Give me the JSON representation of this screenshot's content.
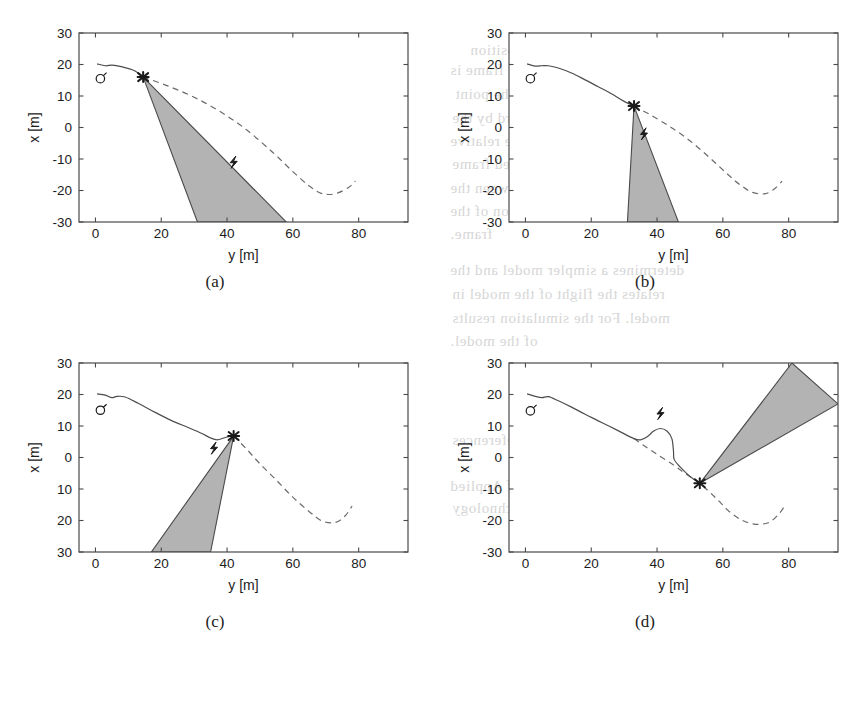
{
  "figure": {
    "title_none": "",
    "panels": [
      {
        "id": "a",
        "caption": "(a)",
        "axes": {
          "xlabel": "y [m]",
          "ylabel": "x [m]",
          "xticks": [
            "0",
            "20",
            "40",
            "60",
            "80"
          ],
          "xtick_values": [
            0,
            20,
            40,
            60,
            80
          ],
          "yticks": [
            "30",
            "20",
            "10",
            "0",
            "-10",
            "-20",
            "-30"
          ],
          "ytick_values": [
            30,
            20,
            10,
            0,
            -10,
            -20,
            -30
          ],
          "xlim": [
            -5,
            95
          ],
          "ylim": [
            -30,
            30
          ],
          "grid": false,
          "box": true
        },
        "markers": {
          "start_circle": {
            "name": "circle-marker",
            "y": 1.5,
            "x": 15.5
          },
          "target_cross": {
            "name": "cross-marker",
            "y": 14.5,
            "x": 16.0
          },
          "glyph": {
            "name": "bolt-glyph",
            "y": 42.0,
            "x": -11.0
          }
        },
        "cone": {
          "apex": [
            14.5,
            16.0
          ],
          "left_base": [
            31.0,
            -30.0
          ],
          "right_base": [
            58.0,
            -30.0
          ],
          "fill": "#b3b3b3"
        },
        "solid_path": [
          [
            0.5,
            20.2
          ],
          [
            3,
            19.6
          ],
          [
            5,
            19.8
          ],
          [
            7,
            19.5
          ],
          [
            9,
            19.0
          ],
          [
            11,
            18.4
          ],
          [
            13,
            17.3
          ],
          [
            14.5,
            16.0
          ]
        ],
        "dashed_path": [
          [
            14.5,
            16.0
          ],
          [
            22,
            13.2
          ],
          [
            30,
            9.6
          ],
          [
            38,
            5.0
          ],
          [
            46,
            -0.8
          ],
          [
            54,
            -8.0
          ],
          [
            60,
            -14.0
          ],
          [
            65,
            -18.6
          ],
          [
            69,
            -21.0
          ],
          [
            73,
            -21.0
          ],
          [
            77,
            -19.0
          ],
          [
            79,
            -17.0
          ]
        ]
      },
      {
        "id": "b",
        "caption": "(b)",
        "axes": {
          "xlabel": "y [m]",
          "ylabel": "x [m]",
          "xticks": [
            "0",
            "20",
            "40",
            "60",
            "80"
          ],
          "xtick_values": [
            0,
            20,
            40,
            60,
            80
          ],
          "yticks": [
            "30",
            "20",
            "10",
            "0",
            "-10",
            "-20",
            "-30"
          ],
          "ytick_values": [
            30,
            20,
            10,
            0,
            -10,
            -20,
            -30
          ],
          "xlim": [
            -5,
            95
          ],
          "ylim": [
            -30,
            30
          ],
          "grid": false,
          "box": true
        },
        "markers": {
          "start_circle": {
            "name": "circle-marker",
            "y": 1.5,
            "x": 15.5
          },
          "target_cross": {
            "name": "cross-marker",
            "y": 33.0,
            "x": 6.8
          },
          "glyph": {
            "name": "bolt-glyph",
            "y": 36.0,
            "x": -2.0
          }
        },
        "cone": {
          "apex": [
            33.0,
            6.8
          ],
          "left_base": [
            31.0,
            -30.0
          ],
          "right_base": [
            46.5,
            -30.0
          ],
          "fill": "#b3b3b3"
        },
        "solid_path": [
          [
            0.5,
            20.2
          ],
          [
            3,
            19.5
          ],
          [
            5,
            19.6
          ],
          [
            7,
            19.6
          ],
          [
            10,
            18.9
          ],
          [
            14,
            17.3
          ],
          [
            18,
            15.2
          ],
          [
            22,
            13.0
          ],
          [
            26,
            10.8
          ],
          [
            30,
            8.3
          ],
          [
            33,
            6.8
          ]
        ],
        "dashed_path": [
          [
            33.0,
            6.8
          ],
          [
            38,
            4.0
          ],
          [
            44,
            0.2
          ],
          [
            50,
            -4.2
          ],
          [
            56,
            -9.6
          ],
          [
            61,
            -14.4
          ],
          [
            65,
            -18.0
          ],
          [
            69,
            -20.6
          ],
          [
            73,
            -21.0
          ],
          [
            76,
            -19.2
          ],
          [
            78,
            -17.0
          ]
        ]
      },
      {
        "id": "c",
        "caption": "(c)",
        "axes": {
          "xlabel": "y [m]",
          "ylabel": "x [m]",
          "xticks": [
            "0",
            "20",
            "40",
            "60",
            "80"
          ],
          "xtick_values": [
            0,
            20,
            40,
            60,
            80
          ],
          "yticks": [
            "30",
            "20",
            "10",
            "0",
            "10",
            "20",
            "30"
          ],
          "ytick_values": [
            30,
            20,
            10,
            0,
            -10,
            -20,
            -30
          ],
          "xlim": [
            -5,
            95
          ],
          "ylim": [
            -30,
            30
          ],
          "grid": false,
          "box": true
        },
        "markers": {
          "start_circle": {
            "name": "circle-marker",
            "y": 1.5,
            "x": 15.0
          },
          "target_cross": {
            "name": "cross-marker",
            "y": 42.0,
            "x": 6.8
          },
          "glyph": {
            "name": "bolt-glyph",
            "y": 36.0,
            "x": 3.0
          }
        },
        "cone": {
          "apex": [
            42.0,
            6.8
          ],
          "left_base": [
            17.0,
            -30.0
          ],
          "right_base": [
            35.0,
            -30.0
          ],
          "fill": "#b3b3b3"
        },
        "solid_path": [
          [
            0.5,
            20.2
          ],
          [
            3,
            19.8
          ],
          [
            5,
            19.0
          ],
          [
            6.5,
            19.4
          ],
          [
            9,
            19.2
          ],
          [
            13,
            17.2
          ],
          [
            18,
            14.4
          ],
          [
            23,
            11.8
          ],
          [
            28,
            9.6
          ],
          [
            32,
            7.8
          ],
          [
            35,
            6.2
          ],
          [
            37,
            5.6
          ],
          [
            39,
            6.2
          ],
          [
            41,
            6.8
          ],
          [
            42,
            6.8
          ]
        ],
        "dashed_path": [
          [
            42.0,
            6.8
          ],
          [
            46,
            2.6
          ],
          [
            50,
            -2.0
          ],
          [
            55,
            -7.2
          ],
          [
            60,
            -12.6
          ],
          [
            65,
            -17.2
          ],
          [
            69,
            -20.2
          ],
          [
            73,
            -20.6
          ],
          [
            76,
            -18.4
          ],
          [
            78,
            -15.4
          ]
        ]
      },
      {
        "id": "d",
        "caption": "(d)",
        "axes": {
          "xlabel": "y [m]",
          "ylabel": "x [m]",
          "xticks": [
            "0",
            "20",
            "40",
            "60",
            "80"
          ],
          "xtick_values": [
            0,
            20,
            40,
            60,
            80
          ],
          "yticks": [
            "30",
            "20",
            "10",
            "0",
            "-10",
            "-20",
            "-30"
          ],
          "ytick_values": [
            30,
            20,
            10,
            0,
            -10,
            -20,
            -30
          ],
          "xlim": [
            -5,
            95
          ],
          "ylim": [
            -30,
            30
          ],
          "grid": false,
          "box": true
        },
        "markers": {
          "start_circle": {
            "name": "circle-marker",
            "y": 1.5,
            "x": 14.8
          },
          "target_cross": {
            "name": "cross-marker",
            "y": 53.0,
            "x": -8.2
          },
          "glyph": {
            "name": "bolt-glyph",
            "y": 41.0,
            "x": 14.0
          }
        },
        "cone": {
          "apex": [
            53.0,
            -8.2
          ],
          "left_base": [
            81.0,
            30.0
          ],
          "right_base": [
            95.0,
            17.0
          ],
          "fill": "#b3b3b3"
        },
        "solid_path": [
          [
            0.5,
            20.2
          ],
          [
            3,
            19.4
          ],
          [
            5,
            19.0
          ],
          [
            7,
            19.3
          ],
          [
            10,
            18.0
          ],
          [
            14,
            16.0
          ],
          [
            18,
            13.8
          ],
          [
            23,
            11.2
          ],
          [
            28,
            8.6
          ],
          [
            33,
            6.0
          ],
          [
            35,
            5.6
          ],
          [
            37,
            6.6
          ],
          [
            39,
            8.4
          ],
          [
            41,
            9.2
          ],
          [
            43,
            8.4
          ],
          [
            44.5,
            6.0
          ],
          [
            45,
            2.0
          ],
          [
            45.2,
            -0.6
          ],
          [
            47,
            -3.0
          ],
          [
            50,
            -6.0
          ],
          [
            53,
            -8.2
          ]
        ],
        "dashed_path": [
          [
            33,
            6.0
          ],
          [
            36,
            3.8
          ],
          [
            40,
            1.0
          ],
          [
            45,
            -2.4
          ],
          [
            49,
            -5.4
          ],
          [
            53,
            -8.2
          ],
          [
            58,
            -13.0
          ],
          [
            62,
            -17.2
          ],
          [
            66,
            -20.0
          ],
          [
            70,
            -21.2
          ],
          [
            74,
            -20.6
          ],
          [
            77,
            -18.0
          ],
          [
            79,
            -15.0
          ]
        ]
      }
    ],
    "style": {
      "axis_color": "#4a4a4a",
      "solid_line_color": "#4d4d4d",
      "dashed_line_color": "#6b6b6b",
      "cone_fill": "#b3b3b3",
      "cone_edge": "#4a4a4a",
      "marker_color": "#1a1a1a"
    }
  },
  "background_text": {
    "lines": [
      {
        "text": "position",
        "x": 470,
        "y": 42
      },
      {
        "text": "the system. The body fixed frame is",
        "x": 450,
        "y": 62
      },
      {
        "text": "geometrically located at the point",
        "x": 455,
        "y": 86
      },
      {
        "text": "one axes held forward by the",
        "x": 452,
        "y": 110
      },
      {
        "text": "centre. The origin is in the relative",
        "x": 450,
        "y": 133
      },
      {
        "text": "to the left. This body fixed frame",
        "x": 452,
        "y": 156
      },
      {
        "text": "the transformation between the",
        "x": 450,
        "y": 180
      },
      {
        "text": "right and the position of the",
        "x": 450,
        "y": 203
      },
      {
        "text": "frame.",
        "x": 450,
        "y": 226
      },
      {
        "text": "determines a simpler model and the",
        "x": 450,
        "y": 262
      },
      {
        "text": "relates the flight of the model in",
        "x": 452,
        "y": 286
      },
      {
        "text": "model. For the simulation results",
        "x": 452,
        "y": 310
      },
      {
        "text": "of the model.",
        "x": 450,
        "y": 333
      },
      {
        "text": "References",
        "x": 452,
        "y": 432
      },
      {
        "text": "Publications of Applied",
        "x": 450,
        "y": 478
      },
      {
        "text": "University of Technology",
        "x": 452,
        "y": 500
      }
    ]
  }
}
